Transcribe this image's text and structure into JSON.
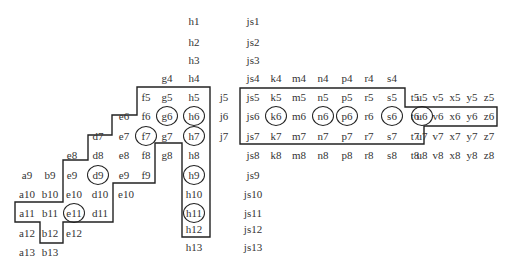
{
  "diagram": {
    "cells": [
      {
        "t": "h1",
        "x": 194,
        "y": 21
      },
      {
        "t": "js1",
        "x": 253,
        "y": 21
      },
      {
        "t": "h2",
        "x": 194,
        "y": 42
      },
      {
        "t": "js2",
        "x": 253,
        "y": 42
      },
      {
        "t": "h3",
        "x": 194,
        "y": 60
      },
      {
        "t": "js3",
        "x": 253,
        "y": 60
      },
      {
        "t": "g4",
        "x": 167,
        "y": 78
      },
      {
        "t": "h4",
        "x": 194,
        "y": 78
      },
      {
        "t": "js4",
        "x": 253,
        "y": 78
      },
      {
        "t": "k4",
        "x": 276,
        "y": 78
      },
      {
        "t": "m4",
        "x": 299,
        "y": 78
      },
      {
        "t": "n4",
        "x": 323,
        "y": 78
      },
      {
        "t": "p4",
        "x": 347,
        "y": 78
      },
      {
        "t": "r4",
        "x": 369,
        "y": 78
      },
      {
        "t": "s4",
        "x": 392,
        "y": 78
      },
      {
        "t": "f5",
        "x": 146,
        "y": 97
      },
      {
        "t": "g5",
        "x": 167,
        "y": 97
      },
      {
        "t": "h5",
        "x": 194,
        "y": 97
      },
      {
        "t": "j5",
        "x": 224,
        "y": 97
      },
      {
        "t": "js5",
        "x": 253,
        "y": 97
      },
      {
        "t": "k5",
        "x": 276,
        "y": 97
      },
      {
        "t": "m5",
        "x": 299,
        "y": 97
      },
      {
        "t": "n5",
        "x": 323,
        "y": 97
      },
      {
        "t": "p5",
        "x": 347,
        "y": 97
      },
      {
        "t": "r5",
        "x": 369,
        "y": 97
      },
      {
        "t": "s5",
        "x": 392,
        "y": 97
      },
      {
        "t": "t5",
        "x": 415,
        "y": 97
      },
      {
        "t": "u5",
        "x": 438,
        "y": 97
      },
      {
        "t": "v5",
        "x": 456,
        "y": 97
      },
      {
        "t": "x5",
        "x": 474,
        "y": 97
      },
      {
        "t": "y5",
        "x": 491,
        "y": 97
      },
      {
        "t": "z5",
        "x": 489,
        "y": 97
      },
      {
        "t": "e6",
        "x": 124,
        "y": 116
      },
      {
        "t": "f6",
        "x": 146,
        "y": 116
      },
      {
        "t": "g6",
        "x": 167,
        "y": 116
      },
      {
        "t": "h6",
        "x": 194,
        "y": 116
      },
      {
        "t": "j6",
        "x": 224,
        "y": 116
      },
      {
        "t": "js6",
        "x": 253,
        "y": 116
      },
      {
        "t": "k6",
        "x": 276,
        "y": 116
      },
      {
        "t": "m6",
        "x": 299,
        "y": 116
      },
      {
        "t": "n6",
        "x": 323,
        "y": 116
      },
      {
        "t": "p6",
        "x": 347,
        "y": 116
      },
      {
        "t": "r6",
        "x": 369,
        "y": 116
      },
      {
        "t": "s6",
        "x": 392,
        "y": 116
      },
      {
        "t": "t6",
        "x": 415,
        "y": 116
      },
      {
        "t": "u6",
        "x": 434,
        "y": 116
      },
      {
        "t": "v6",
        "x": 454,
        "y": 116
      },
      {
        "t": "x6",
        "x": 474,
        "y": 116
      },
      {
        "t": "y6",
        "x": 491,
        "y": 116
      },
      {
        "t": "z6",
        "x": 489,
        "y": 116
      },
      {
        "t": "d7",
        "x": 98,
        "y": 136
      },
      {
        "t": "e7",
        "x": 124,
        "y": 136
      },
      {
        "t": "f7",
        "x": 146,
        "y": 136
      },
      {
        "t": "g7",
        "x": 167,
        "y": 136
      },
      {
        "t": "h7",
        "x": 194,
        "y": 136
      },
      {
        "t": "j7",
        "x": 224,
        "y": 136
      },
      {
        "t": "js7",
        "x": 253,
        "y": 136
      },
      {
        "t": "k7",
        "x": 276,
        "y": 136
      },
      {
        "t": "m7",
        "x": 299,
        "y": 136
      },
      {
        "t": "n7",
        "x": 323,
        "y": 136
      },
      {
        "t": "p7",
        "x": 347,
        "y": 136
      },
      {
        "t": "r7",
        "x": 369,
        "y": 136
      },
      {
        "t": "s7",
        "x": 392,
        "y": 136
      },
      {
        "t": "t7",
        "x": 415,
        "y": 136
      },
      {
        "t": "u7",
        "x": 433,
        "y": 136
      },
      {
        "t": "v7",
        "x": 454,
        "y": 136
      },
      {
        "t": "x7",
        "x": 474,
        "y": 136
      },
      {
        "t": "y7",
        "x": 491,
        "y": 136
      },
      {
        "t": "z7",
        "x": 489,
        "y": 136
      },
      {
        "t": "e8",
        "x": 72,
        "y": 155
      },
      {
        "t": "d8",
        "x": 98,
        "y": 155
      },
      {
        "t": "e8",
        "x": 124,
        "y": 155
      },
      {
        "t": "f8",
        "x": 146,
        "y": 155
      },
      {
        "t": "g8",
        "x": 167,
        "y": 155
      },
      {
        "t": "h8",
        "x": 194,
        "y": 155
      },
      {
        "t": "js8",
        "x": 253,
        "y": 155
      },
      {
        "t": "k8",
        "x": 276,
        "y": 155
      },
      {
        "t": "m8",
        "x": 299,
        "y": 155
      },
      {
        "t": "n8",
        "x": 323,
        "y": 155
      },
      {
        "t": "p8",
        "x": 347,
        "y": 155
      },
      {
        "t": "r8",
        "x": 369,
        "y": 155
      },
      {
        "t": "s8",
        "x": 392,
        "y": 155
      },
      {
        "t": "t8",
        "x": 415,
        "y": 155
      },
      {
        "t": "u8",
        "x": 433,
        "y": 155
      },
      {
        "t": "v8",
        "x": 454,
        "y": 155
      },
      {
        "t": "x8",
        "x": 474,
        "y": 155
      },
      {
        "t": "y8",
        "x": 491,
        "y": 155
      },
      {
        "t": "z8",
        "x": 489,
        "y": 155
      },
      {
        "t": "a9",
        "x": 27,
        "y": 175
      },
      {
        "t": "b9",
        "x": 50,
        "y": 175
      },
      {
        "t": "e9",
        "x": 72,
        "y": 175
      },
      {
        "t": "d9",
        "x": 98,
        "y": 175
      },
      {
        "t": "e9",
        "x": 124,
        "y": 175
      },
      {
        "t": "f9",
        "x": 146,
        "y": 175
      },
      {
        "t": "h9",
        "x": 194,
        "y": 175
      },
      {
        "t": "js9",
        "x": 253,
        "y": 175
      },
      {
        "t": "a10",
        "x": 27,
        "y": 194
      },
      {
        "t": "b10",
        "x": 50,
        "y": 194
      },
      {
        "t": "e10",
        "x": 74,
        "y": 194
      },
      {
        "t": "d10",
        "x": 100,
        "y": 194
      },
      {
        "t": "e10",
        "x": 126,
        "y": 194
      },
      {
        "t": "h10",
        "x": 194,
        "y": 194
      },
      {
        "t": "js10",
        "x": 253,
        "y": 194
      },
      {
        "t": "a11",
        "x": 27,
        "y": 213
      },
      {
        "t": "b11",
        "x": 50,
        "y": 213
      },
      {
        "t": "e11",
        "x": 74,
        "y": 213
      },
      {
        "t": "d11",
        "x": 100,
        "y": 213
      },
      {
        "t": "h11",
        "x": 194,
        "y": 213
      },
      {
        "t": "js11",
        "x": 253,
        "y": 213
      },
      {
        "t": "a12",
        "x": 27,
        "y": 233
      },
      {
        "t": "b12",
        "x": 50,
        "y": 233
      },
      {
        "t": "e12",
        "x": 74,
        "y": 233
      },
      {
        "t": "h12",
        "x": 194,
        "y": 229
      },
      {
        "t": "js12",
        "x": 253,
        "y": 229
      },
      {
        "t": "a13",
        "x": 27,
        "y": 252
      },
      {
        "t": "b13",
        "x": 50,
        "y": 252
      },
      {
        "t": "h13",
        "x": 194,
        "y": 247
      },
      {
        "t": "js13",
        "x": 253,
        "y": 247
      }
    ],
    "circled": [
      {
        "t": "g6",
        "x": 167,
        "y": 116
      },
      {
        "t": "h6",
        "x": 194,
        "y": 116
      },
      {
        "t": "f7",
        "x": 146,
        "y": 136
      },
      {
        "t": "h7",
        "x": 194,
        "y": 136
      },
      {
        "t": "d9",
        "x": 98,
        "y": 175
      },
      {
        "t": "h9",
        "x": 194,
        "y": 175
      },
      {
        "t": "e11",
        "x": 74,
        "y": 213
      },
      {
        "t": "h11",
        "x": 194,
        "y": 213
      },
      {
        "t": "k6",
        "x": 276,
        "y": 116
      },
      {
        "t": "n6",
        "x": 323,
        "y": 116
      },
      {
        "t": "p6",
        "x": 347,
        "y": 116
      },
      {
        "t": "s6",
        "x": 392,
        "y": 116
      },
      {
        "t": "u6",
        "x": 434,
        "y": 116
      }
    ],
    "regions": [
      {
        "name": "left-region",
        "points": "137,87 210,87 210,237 182,237 182,143 155,143 155,183 113,183 113,222 63,222 63,243 40,243 40,222 15,222 15,202 63,202 63,160 88,160 88,135 112,135 112,115 137,115"
      },
      {
        "name": "right-region",
        "points": "240,88 405,88 405,107 497,107 497,126 424,126 424,144 240,144"
      }
    ],
    "line_color": "#222222"
  }
}
